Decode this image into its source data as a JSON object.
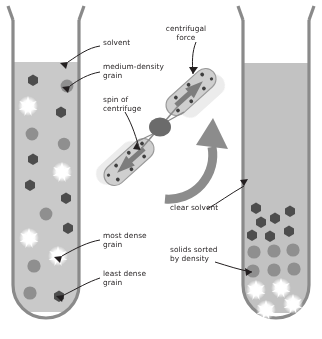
{
  "diagram": {
    "colors": {
      "solvent": "#c9c9c9",
      "solvent_clear": "#c2c2c2",
      "tube_wall": "#8a8a8a",
      "grain_dark": "#4d4d4d",
      "grain_medium": "#8f8f8f",
      "grain_light": "#ffffff",
      "arrow": "#6e6e6e",
      "text": "#231f20",
      "rotor_hub": "#6b6b6b",
      "ghost": "#dcdcdc"
    },
    "labels": [
      {
        "id": "solvent",
        "text": "solvent",
        "x": 103,
        "y": 42,
        "align": "left"
      },
      {
        "id": "medium-density-grain",
        "text": "medium-density\ngrain",
        "x": 103,
        "y": 66,
        "align": "left"
      },
      {
        "id": "spin-of-centrifuge",
        "text": "spin of\ncentrifuge",
        "x": 103,
        "y": 99,
        "align": "left"
      },
      {
        "id": "centrifugal-force",
        "text": "centrifugal\nforce",
        "x": 176,
        "y": 27,
        "align": "center"
      },
      {
        "id": "clear-solvent",
        "text": "clear solvent",
        "x": 170,
        "y": 206,
        "align": "left"
      },
      {
        "id": "most-dense-grain",
        "text": "most dense\ngrain",
        "x": 103,
        "y": 234,
        "align": "left"
      },
      {
        "id": "least-dense-grain",
        "text": "least dense\ngrain",
        "x": 103,
        "y": 272,
        "align": "left"
      },
      {
        "id": "solids-sorted-by-density",
        "text": "solids sorted\nby density",
        "x": 170,
        "y": 248,
        "align": "left"
      }
    ],
    "left_tube": {
      "name": "unsorted-mixture-tube",
      "solvent_top_y": 62,
      "description": "grains randomly suspended in solvent",
      "grains": [
        {
          "type": "dark",
          "cx": 33,
          "cy": 80
        },
        {
          "type": "medium",
          "cx": 67,
          "cy": 86
        },
        {
          "type": "light",
          "cx": 28,
          "cy": 106
        },
        {
          "type": "dark",
          "cx": 61,
          "cy": 112
        },
        {
          "type": "medium",
          "cx": 32,
          "cy": 134
        },
        {
          "type": "medium",
          "cx": 64,
          "cy": 144
        },
        {
          "type": "dark",
          "cx": 33,
          "cy": 159
        },
        {
          "type": "light",
          "cx": 62,
          "cy": 172
        },
        {
          "type": "dark",
          "cx": 30,
          "cy": 185
        },
        {
          "type": "dark",
          "cx": 66,
          "cy": 198
        },
        {
          "type": "medium",
          "cx": 46,
          "cy": 214
        },
        {
          "type": "dark",
          "cx": 68,
          "cy": 228
        },
        {
          "type": "light",
          "cx": 29,
          "cy": 238
        },
        {
          "type": "light",
          "cx": 58,
          "cy": 256
        },
        {
          "type": "medium",
          "cx": 34,
          "cy": 266
        },
        {
          "type": "medium",
          "cx": 30,
          "cy": 293
        },
        {
          "type": "dark",
          "cx": 59,
          "cy": 296
        }
      ]
    },
    "right_tube": {
      "name": "sorted-mixture-tube",
      "solvent_top_y": 63,
      "description": "grains sorted into density layers after spinning",
      "grains": [
        {
          "type": "dark",
          "cx": 256,
          "cy": 208
        },
        {
          "type": "dark",
          "cx": 290,
          "cy": 211
        },
        {
          "type": "dark",
          "cx": 261,
          "cy": 222
        },
        {
          "type": "dark",
          "cx": 275,
          "cy": 218
        },
        {
          "type": "dark",
          "cx": 252,
          "cy": 235
        },
        {
          "type": "dark",
          "cx": 270,
          "cy": 236
        },
        {
          "type": "dark",
          "cx": 289,
          "cy": 231
        },
        {
          "type": "medium",
          "cx": 254,
          "cy": 252
        },
        {
          "type": "medium",
          "cx": 274,
          "cy": 251
        },
        {
          "type": "medium",
          "cx": 293,
          "cy": 250
        },
        {
          "type": "medium",
          "cx": 253,
          "cy": 271
        },
        {
          "type": "medium",
          "cx": 274,
          "cy": 270
        },
        {
          "type": "medium",
          "cx": 294,
          "cy": 269
        },
        {
          "type": "light",
          "cx": 256,
          "cy": 290
        },
        {
          "type": "light",
          "cx": 281,
          "cy": 288
        },
        {
          "type": "light",
          "cx": 266,
          "cy": 310
        },
        {
          "type": "light",
          "cx": 293,
          "cy": 304
        }
      ]
    },
    "centrifuge": {
      "name": "spinning-centrifuge-rotor",
      "hub": {
        "cx": 160,
        "cy": 127
      },
      "tubes": 2,
      "spin_direction": "counterclockwise",
      "force_arrow_direction": "outward from hub"
    }
  }
}
